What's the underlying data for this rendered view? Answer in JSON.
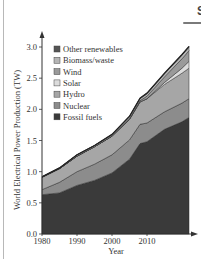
{
  "page": {
    "section_heading": "S"
  },
  "chart_data": {
    "type": "area",
    "stacked": true,
    "title": "",
    "xlabel": "Year",
    "ylabel": "World Electrical Power Production (TW)",
    "xlim": [
      1980,
      2022
    ],
    "ylim": [
      0.0,
      3.0
    ],
    "x_ticks": [
      1980,
      1990,
      2000,
      2010
    ],
    "y_ticks": [
      "0.0",
      "0.5",
      "1.0",
      "1.5",
      "2.0",
      "2.5",
      "3.0"
    ],
    "grid": false,
    "legend_position": "upper left",
    "x": [
      1980,
      1985,
      1990,
      1995,
      2000,
      2005,
      2008,
      2010,
      2015,
      2020,
      2022
    ],
    "series": [
      {
        "name": "Fossil fuels",
        "color": "#3a3a3a",
        "values": [
          0.63,
          0.66,
          0.78,
          0.86,
          0.98,
          1.2,
          1.45,
          1.48,
          1.68,
          1.8,
          1.87
        ]
      },
      {
        "name": "Nuclear",
        "color": "#8c8c8c",
        "values": [
          0.08,
          0.17,
          0.22,
          0.26,
          0.29,
          0.31,
          0.31,
          0.3,
          0.28,
          0.3,
          0.3
        ]
      },
      {
        "name": "Hydro",
        "color": "#a6a6a6",
        "values": [
          0.2,
          0.22,
          0.25,
          0.28,
          0.3,
          0.33,
          0.36,
          0.39,
          0.44,
          0.48,
          0.49
        ]
      },
      {
        "name": "Solar",
        "color": "#dcdcdc",
        "values": [
          0.0,
          0.0,
          0.0,
          0.0,
          0.0,
          0.0,
          0.0,
          0.0,
          0.03,
          0.08,
          0.11
        ]
      },
      {
        "name": "Wind",
        "color": "#9a9a9a",
        "values": [
          0.0,
          0.0,
          0.0,
          0.0,
          0.0,
          0.01,
          0.02,
          0.04,
          0.09,
          0.15,
          0.17
        ]
      },
      {
        "name": "Biomass/waste",
        "color": "#b5b5b5",
        "values": [
          0.01,
          0.01,
          0.02,
          0.02,
          0.02,
          0.03,
          0.03,
          0.04,
          0.05,
          0.06,
          0.06
        ]
      },
      {
        "name": "Other renewables",
        "color": "#555555",
        "values": [
          0.0,
          0.0,
          0.0,
          0.0,
          0.01,
          0.01,
          0.01,
          0.01,
          0.01,
          0.01,
          0.01
        ]
      }
    ],
    "legend": [
      "Other renewables",
      "Biomass/waste",
      "Wind",
      "Solar",
      "Hydro",
      "Nuclear",
      "Fossil fuels"
    ]
  }
}
